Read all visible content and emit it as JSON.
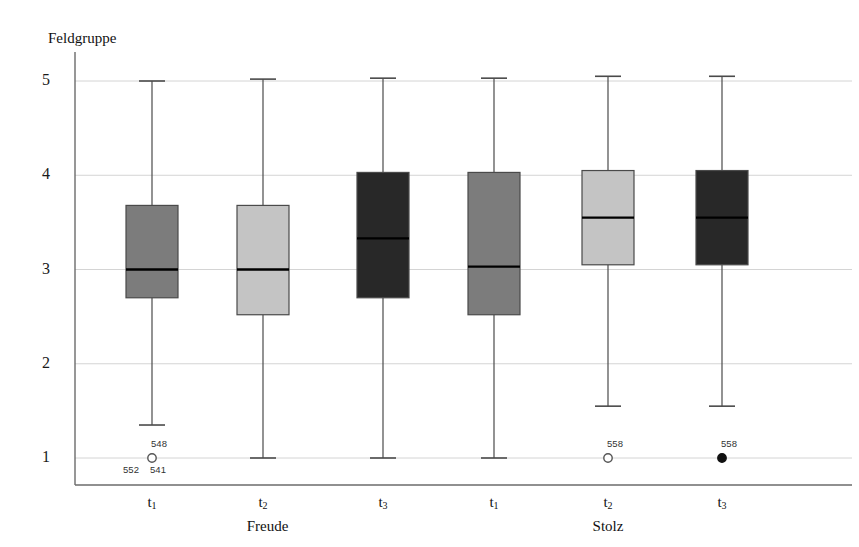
{
  "chart_data": {
    "type": "box",
    "title": "",
    "ylabel": "Feldgruppe",
    "xlabel": "",
    "ylim": [
      0.78,
      5.3
    ],
    "yticks": [
      5,
      4,
      3,
      2,
      1
    ],
    "ytick_labels": [
      "5",
      "4",
      "3",
      "2",
      "1"
    ],
    "grid": true,
    "legend": "none",
    "groups": [
      {
        "name": "Freude",
        "categories": [
          "t1",
          "t2",
          "t3"
        ]
      },
      {
        "name": "Stolz",
        "categories": [
          "t1",
          "t2",
          "t3"
        ]
      }
    ],
    "categories": [
      "t1",
      "t2",
      "t3",
      "t1",
      "t2",
      "t3"
    ],
    "category_labels": [
      "t",
      "t",
      "t",
      "t",
      "t",
      "t"
    ],
    "category_subscripts": [
      "1",
      "2",
      "3",
      "1",
      "2",
      "3"
    ],
    "boxes": [
      {
        "label": "t1",
        "group": "Freude",
        "fill": "#7c7c7c",
        "whisker_low": 1.35,
        "q1": 2.7,
        "median": 3.0,
        "q3": 3.68,
        "whisker_high": 5.0,
        "outliers": [
          {
            "value": 1.0,
            "labels_above": [
              "548"
            ],
            "labels_below": [
              "552",
              "541"
            ],
            "filled": false
          }
        ]
      },
      {
        "label": "t2",
        "group": "Freude",
        "fill": "#c4c4c4",
        "whisker_low": 1.0,
        "q1": 2.52,
        "median": 3.0,
        "q3": 3.68,
        "whisker_high": 5.02,
        "outliers": []
      },
      {
        "label": "t3",
        "group": "Freude",
        "fill": "#282828",
        "whisker_low": 1.0,
        "q1": 2.7,
        "median": 3.33,
        "q3": 4.03,
        "whisker_high": 5.03,
        "outliers": []
      },
      {
        "label": "t1",
        "group": "Stolz",
        "fill": "#7c7c7c",
        "whisker_low": 1.0,
        "q1": 2.52,
        "median": 3.03,
        "q3": 4.03,
        "whisker_high": 5.03,
        "outliers": []
      },
      {
        "label": "t2",
        "group": "Stolz",
        "fill": "#c4c4c4",
        "whisker_low": 1.55,
        "q1": 3.05,
        "median": 3.55,
        "q3": 4.05,
        "whisker_high": 5.05,
        "outliers": [
          {
            "value": 1.0,
            "labels_above": [
              "558"
            ],
            "labels_below": [],
            "filled": false
          }
        ]
      },
      {
        "label": "t3",
        "group": "Stolz",
        "fill": "#282828",
        "whisker_low": 1.55,
        "q1": 3.05,
        "median": 3.55,
        "q3": 4.05,
        "whisker_high": 5.05,
        "outliers": [
          {
            "value": 1.0,
            "labels_above": [
              "558"
            ],
            "labels_below": [],
            "filled": true
          }
        ]
      }
    ],
    "colors": {
      "axis": "#6b6b6b",
      "grid": "#d4d4d4",
      "whisker": "#4a4a4a",
      "median": "#000000",
      "box_border": "#4a4a4a",
      "text": "#1a1a1a"
    }
  }
}
